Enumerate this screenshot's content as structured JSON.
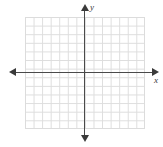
{
  "figure": {
    "kind": "blank-coordinate-plane",
    "background_color": "#ffffff"
  },
  "axes": {
    "x": {
      "label": "x",
      "label_style": "italic",
      "color": "#3a3a3a",
      "orientation": "horizontal",
      "arrowheads": [
        "left",
        "right"
      ],
      "tick_labels": []
    },
    "y": {
      "label": "y",
      "label_style": "italic",
      "color": "#3a3a3a",
      "orientation": "vertical",
      "arrowheads": [
        "up",
        "down"
      ],
      "tick_labels": []
    }
  },
  "grid": {
    "visible": true,
    "color": "#d8d8d8",
    "border_color": "#dcdcdc",
    "columns": 14,
    "rows": 13,
    "cell_width_px": 8.57,
    "cell_height_px": 8.62
  },
  "chart_data": {
    "type": "scatter",
    "title": "",
    "subtitle": "",
    "xlabel": "x",
    "ylabel": "y",
    "xlim": [
      -7,
      7
    ],
    "ylim": [
      -6.5,
      6.5
    ],
    "grid": true,
    "legend": null,
    "xticks": [],
    "yticks": [],
    "series": [
      {
        "name": "",
        "x": [],
        "y": []
      }
    ],
    "annotations": []
  }
}
